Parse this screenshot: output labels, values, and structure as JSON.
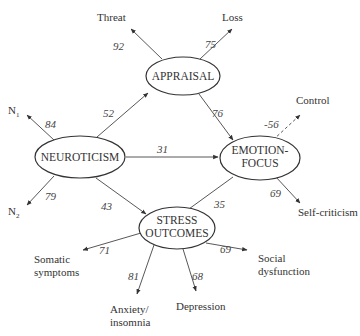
{
  "diagram": {
    "type": "path-model",
    "nodes": {
      "appraisal": {
        "label": "APPRAISAL"
      },
      "neuroticism": {
        "label": "NEUROTICISM"
      },
      "emotion_focus": {
        "line1": "EMOTION-",
        "line2": "FOCUS"
      },
      "stress_outcomes": {
        "line1": "STRESS",
        "line2": "OUTCOMES"
      }
    },
    "indicators": {
      "threat": "Threat",
      "loss": "Loss",
      "n1_base": "N",
      "n1_sub": "1",
      "n2_base": "N",
      "n2_sub": "2",
      "control": "Control",
      "self_criticism": "Self-criticism",
      "somatic_line1": "Somatic",
      "somatic_line2": "symptoms",
      "anxiety_line1": "Anxiety/",
      "anxiety_line2": "insomnia",
      "depression": "Depression",
      "social_line1": "Social",
      "social_line2": "dysfunction"
    },
    "coefficients": {
      "threat": "92",
      "loss": "75",
      "n1": "84",
      "n2": "79",
      "neuroticism_appraisal": "52",
      "appraisal_emotion": "76",
      "neuroticism_emotion": "31",
      "neuroticism_stress": "43",
      "emotion_stress": "35",
      "control": "-56",
      "self_criticism": "69",
      "somatic": "71",
      "anxiety": "81",
      "depression": "68",
      "social": "69"
    },
    "edges": [
      {
        "from": "APPRAISAL",
        "to": "Threat",
        "value": 92
      },
      {
        "from": "APPRAISAL",
        "to": "Loss",
        "value": 75
      },
      {
        "from": "NEUROTICISM",
        "to": "N1",
        "value": 84
      },
      {
        "from": "NEUROTICISM",
        "to": "N2",
        "value": 79
      },
      {
        "from": "NEUROTICISM",
        "to": "APPRAISAL",
        "value": 52
      },
      {
        "from": "APPRAISAL",
        "to": "EMOTION-FOCUS",
        "value": 76
      },
      {
        "from": "NEUROTICISM",
        "to": "EMOTION-FOCUS",
        "value": 31
      },
      {
        "from": "NEUROTICISM",
        "to": "STRESS OUTCOMES",
        "value": 43
      },
      {
        "from": "EMOTION-FOCUS",
        "to": "STRESS OUTCOMES",
        "value": 35
      },
      {
        "from": "EMOTION-FOCUS",
        "to": "Control",
        "value": -56,
        "style": "dashed"
      },
      {
        "from": "EMOTION-FOCUS",
        "to": "Self-criticism",
        "value": 69
      },
      {
        "from": "STRESS OUTCOMES",
        "to": "Somatic symptoms",
        "value": 71
      },
      {
        "from": "STRESS OUTCOMES",
        "to": "Anxiety/insomnia",
        "value": 81
      },
      {
        "from": "STRESS OUTCOMES",
        "to": "Depression",
        "value": 68
      },
      {
        "from": "STRESS OUTCOMES",
        "to": "Social dysfunction",
        "value": 69
      }
    ],
    "colors": {
      "stroke": "#333333",
      "background": "#ffffff",
      "text": "#333333"
    }
  }
}
